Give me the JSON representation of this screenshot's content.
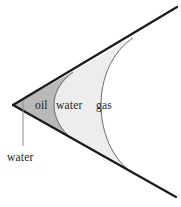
{
  "diagram": {
    "background_color": "#ffffff",
    "outline_color": "#1a1a1a",
    "curve_color": "#4d4d4d",
    "leader_color": "#8c8c8c",
    "text_color": "#231f20",
    "regions": [
      {
        "id": "oil",
        "label": "oil",
        "fill": "#b9b9b9",
        "label_x": 35,
        "label_y": 100
      },
      {
        "id": "water",
        "label": "water",
        "fill": "#ededed",
        "label_x": 56,
        "label_y": 100
      },
      {
        "id": "gas",
        "label": "gas",
        "fill": "#ffffff",
        "label_x": 96,
        "label_y": 100
      }
    ],
    "callout": {
      "label": "water",
      "label_x": 7,
      "label_y": 152,
      "leader_line": {
        "x1": 23,
        "y1": 101,
        "x2": 23,
        "y2": 146
      }
    },
    "wedge": {
      "apex_x": 13,
      "apex_y": 105,
      "upper_end_x": 177,
      "upper_end_y": 7,
      "lower_end_x": 176,
      "lower_end_y": 197
    }
  }
}
